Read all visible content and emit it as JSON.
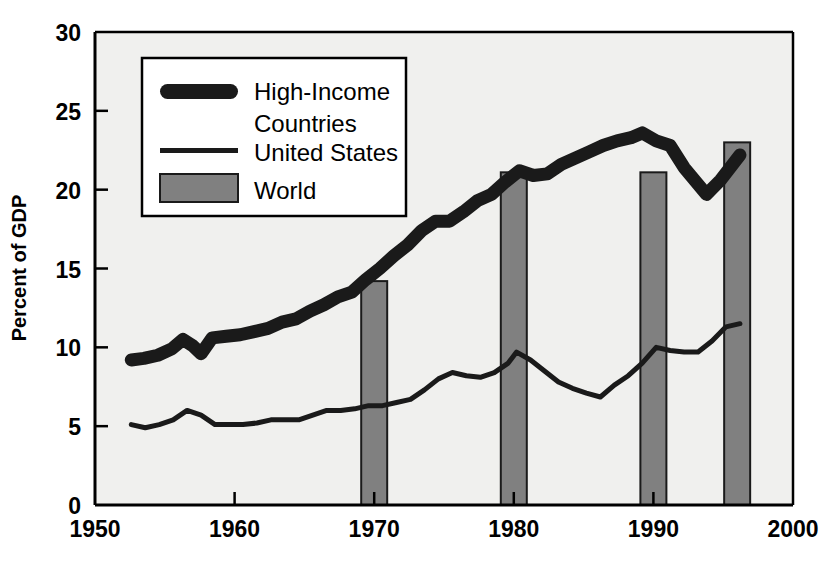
{
  "chart_data": {
    "type": "line",
    "title": "",
    "xlabel": "",
    "ylabel": "Percent of GDP",
    "xlim": [
      1950,
      2000
    ],
    "ylim": [
      0,
      30
    ],
    "xticks": [
      "1950",
      "1960",
      "1970",
      "1980",
      "1990",
      "2000"
    ],
    "yticks": [
      "0",
      "5",
      "10",
      "15",
      "20",
      "25",
      "30"
    ],
    "grid": false,
    "legend_position": "upper-left-inside",
    "series": [
      {
        "name": "High-Income Countries",
        "style": "thick-line",
        "color": "#1a1a1a",
        "x": [
          1952.6,
          1953.5,
          1954.5,
          1955.5,
          1956.3,
          1957.0,
          1957.6,
          1958.4,
          1959.4,
          1960.4,
          1961.4,
          1962.4,
          1963.4,
          1964.4,
          1965.4,
          1966.4,
          1967.4,
          1968.4,
          1969.4,
          1970.4,
          1971.4,
          1972.4,
          1973.4,
          1974.4,
          1975.4,
          1976.4,
          1977.4,
          1978.4,
          1979.4,
          1980.4,
          1981.4,
          1982.4,
          1983.4,
          1984.4,
          1985.4,
          1986.4,
          1987.4,
          1988.4,
          1989.2,
          1990.2,
          1991.2,
          1992.2,
          1993.8,
          1994.8,
          1996.2
        ],
        "y": [
          9.2,
          9.3,
          9.5,
          9.9,
          10.5,
          10.1,
          9.6,
          10.6,
          10.7,
          10.8,
          11.0,
          11.2,
          11.6,
          11.8,
          12.3,
          12.7,
          13.2,
          13.5,
          14.3,
          15.0,
          15.8,
          16.5,
          17.4,
          18.0,
          18.0,
          18.6,
          19.3,
          19.7,
          20.5,
          21.2,
          20.9,
          21.0,
          21.6,
          22.0,
          22.4,
          22.8,
          23.1,
          23.3,
          23.6,
          23.1,
          22.8,
          21.4,
          19.7,
          20.6,
          22.2
        ],
        "description": "Gross domestic investment as a percent of GDP, high-income countries"
      },
      {
        "name": "United States",
        "style": "thin-line",
        "color": "#1a1a1a",
        "x": [
          1952.6,
          1953.6,
          1954.6,
          1955.6,
          1956.6,
          1957.6,
          1958.6,
          1959.6,
          1960.6,
          1961.6,
          1962.6,
          1963.6,
          1964.6,
          1965.6,
          1966.6,
          1967.6,
          1968.6,
          1969.6,
          1970.6,
          1971.6,
          1972.6,
          1973.6,
          1974.6,
          1975.6,
          1976.6,
          1977.6,
          1978.6,
          1979.6,
          1980.2,
          1981.2,
          1982.2,
          1983.2,
          1984.2,
          1985.2,
          1986.2,
          1987.2,
          1988.2,
          1989.2,
          1990.2,
          1991.2,
          1992.2,
          1993.2,
          1994.2,
          1995.2,
          1996.2
        ],
        "y": [
          5.1,
          4.9,
          5.1,
          5.4,
          6.0,
          5.7,
          5.1,
          5.1,
          5.1,
          5.2,
          5.4,
          5.4,
          5.4,
          5.7,
          6.0,
          6.0,
          6.1,
          6.3,
          6.3,
          6.5,
          6.7,
          7.3,
          8.0,
          8.4,
          8.2,
          8.1,
          8.4,
          9.0,
          9.7,
          9.2,
          8.5,
          7.8,
          7.4,
          7.1,
          6.85,
          7.6,
          8.2,
          9.0,
          10.0,
          9.8,
          9.7,
          9.7,
          10.4,
          11.3,
          11.5
        ],
        "description": "Gross domestic investment as a percent of GDP, United States"
      },
      {
        "name": "World",
        "style": "bar",
        "color": "#808080",
        "x": [
          1970,
          1980,
          1990,
          1996
        ],
        "y": [
          14.2,
          21.1,
          21.1,
          23.0
        ],
        "description": "Gross domestic investment as a percent of GDP, world (selected years)"
      }
    ]
  },
  "axes": {
    "y_title": "Percent of GDP",
    "y_ticks": [
      {
        "label": "30",
        "value": 30
      },
      {
        "label": "25",
        "value": 25
      },
      {
        "label": "20",
        "value": 20
      },
      {
        "label": "15",
        "value": 15
      },
      {
        "label": "10",
        "value": 10
      },
      {
        "label": "5",
        "value": 5
      },
      {
        "label": "0",
        "value": 0
      }
    ],
    "x_ticks": [
      {
        "label": "1950",
        "value": 1950
      },
      {
        "label": "1960",
        "value": 1960
      },
      {
        "label": "1970",
        "value": 1970
      },
      {
        "label": "1980",
        "value": 1980
      },
      {
        "label": "1990",
        "value": 1990
      },
      {
        "label": "2000",
        "value": 2000
      }
    ]
  },
  "legend": {
    "entries": [
      {
        "label_line1": "High-Income",
        "label_line2": "Countries",
        "swatch": "thick-line-swatch"
      },
      {
        "label_line1": "United States",
        "label_line2": "",
        "swatch": "thin-line-swatch"
      },
      {
        "label_line1": "World",
        "label_line2": "",
        "swatch": "gray-bar-swatch"
      }
    ]
  },
  "colors": {
    "plot_background": "#f0f0ee",
    "page_background": "#ffffff",
    "line_color": "#1a1a1a",
    "bar_fill": "#808080",
    "bar_stroke": "#1a1a1a",
    "axis_color": "#000000",
    "legend_background": "#ffffff",
    "legend_border": "#000000"
  }
}
